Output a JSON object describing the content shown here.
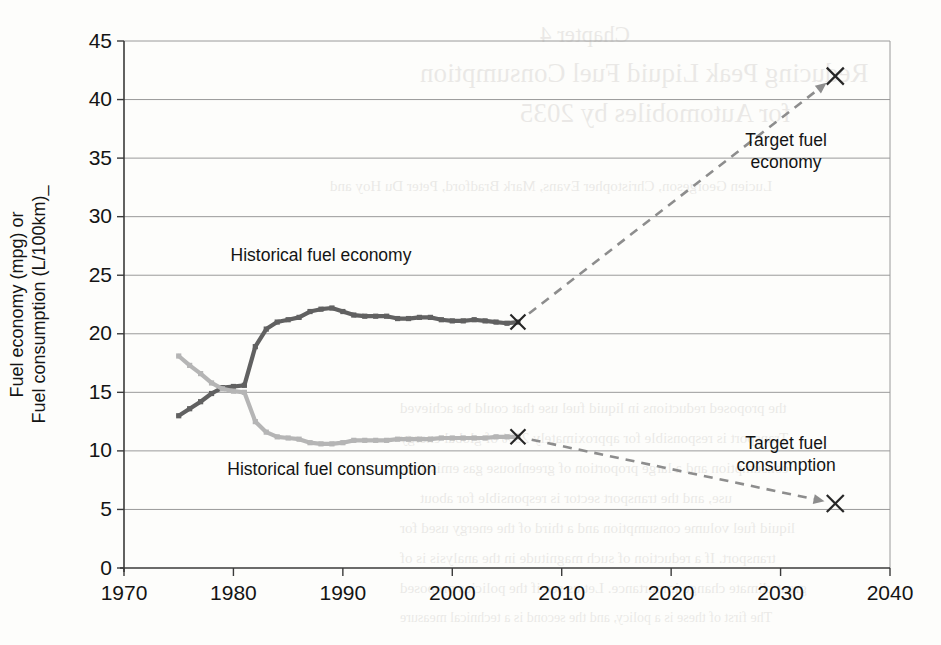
{
  "figure": {
    "background_color": "#fdfdfb",
    "plot_border_color": "#3a3a3a",
    "grid_color": "#9a9a9a"
  },
  "labels": {
    "y_axis_line1": "Fuel economy (mpg) or",
    "y_axis_line2": "Fuel consumption (L/100km)_",
    "series_economy": "Historical fuel economy",
    "series_consumption": "Historical fuel consumption",
    "target_economy_line1": "Target fuel",
    "target_economy_line2": "economy",
    "target_consumption_line1": "Target fuel",
    "target_consumption_line2": "consumption"
  },
  "bleed_through": [
    {
      "text": "Chapter 4",
      "x": 540,
      "y": 22,
      "size": 23
    },
    {
      "text": "Reducing Peak Liquid Fuel Consumption",
      "x": 420,
      "y": 58,
      "size": 27
    },
    {
      "text": "for Automobiles by 2035",
      "x": 520,
      "y": 98,
      "size": 27
    },
    {
      "text": "Lucien Georgeson, Christopher Evans, Mark Bradford, Peter Du Hoy and",
      "x": 330,
      "y": 178,
      "size": 15
    },
    {
      "text": "the proposed reductions in liquid fuel use that could be achieved",
      "x": 400,
      "y": 400,
      "size": 15
    },
    {
      "text": "Transport is responsible for approximately 25% of global energy",
      "x": 400,
      "y": 430,
      "size": 15
    },
    {
      "text": "consumption and a large proportion of greenhouse gas emissions",
      "x": 400,
      "y": 460,
      "size": 15
    },
    {
      "text": "use, and the transport sector is responsible for about",
      "x": 420,
      "y": 490,
      "size": 15
    },
    {
      "text": "liquid fuel volume consumption and a third of the energy used for",
      "x": 400,
      "y": 520,
      "size": 15
    },
    {
      "text": "transport. If a reduction of such magnitude in the analysis is of",
      "x": 400,
      "y": 550,
      "size": 15
    },
    {
      "text": "great climate change importance. Let us see if the policies proposed",
      "x": 400,
      "y": 580,
      "size": 15
    },
    {
      "text": "The first of these is a policy, and the second is a technical measure",
      "x": 400,
      "y": 610,
      "size": 14
    }
  ],
  "chart_data": {
    "type": "line",
    "title": "",
    "xlabel": "",
    "ylabel": "Fuel economy (mpg) or Fuel consumption (L/100km)",
    "xlim": [
      1970,
      2040
    ],
    "ylim": [
      0,
      45
    ],
    "x_ticks": [
      1970,
      1980,
      1990,
      2000,
      2010,
      2020,
      2030,
      2040
    ],
    "y_ticks": [
      0,
      5,
      10,
      15,
      20,
      25,
      30,
      35,
      40,
      45
    ],
    "grid": "horizontal",
    "legend": "in-plot annotations",
    "series": [
      {
        "name": "Historical fuel economy",
        "units": "mpg",
        "color": "#616161",
        "marker": "square",
        "x": [
          1975,
          1976,
          1977,
          1978,
          1979,
          1980,
          1981,
          1982,
          1983,
          1984,
          1985,
          1986,
          1987,
          1988,
          1989,
          1990,
          1991,
          1992,
          1993,
          1994,
          1995,
          1996,
          1997,
          1998,
          1999,
          2000,
          2001,
          2002,
          2003,
          2004,
          2005,
          2006
        ],
        "values": [
          13.0,
          13.6,
          14.2,
          14.9,
          15.4,
          15.5,
          15.6,
          18.9,
          20.4,
          21.0,
          21.2,
          21.4,
          21.9,
          22.1,
          22.2,
          21.9,
          21.6,
          21.5,
          21.5,
          21.5,
          21.3,
          21.3,
          21.4,
          21.4,
          21.2,
          21.1,
          21.1,
          21.2,
          21.1,
          21.0,
          20.9,
          21.0
        ]
      },
      {
        "name": "Historical fuel consumption",
        "units": "L/100km",
        "color": "#b5b5b5",
        "marker": "square",
        "x": [
          1975,
          1976,
          1977,
          1978,
          1979,
          1980,
          1981,
          1982,
          1983,
          1984,
          1985,
          1986,
          1987,
          1988,
          1989,
          1990,
          1991,
          1992,
          1993,
          1994,
          1995,
          1996,
          1997,
          1998,
          1999,
          2000,
          2001,
          2002,
          2003,
          2004,
          2005,
          2006
        ],
        "values": [
          18.1,
          17.3,
          16.6,
          15.8,
          15.3,
          15.1,
          15.0,
          12.5,
          11.6,
          11.2,
          11.1,
          11.0,
          10.7,
          10.6,
          10.6,
          10.7,
          10.9,
          10.9,
          10.9,
          10.9,
          11.0,
          11.0,
          11.0,
          11.0,
          11.1,
          11.1,
          11.1,
          11.1,
          11.1,
          11.2,
          11.2,
          11.2
        ]
      }
    ],
    "targets": [
      {
        "name": "Target fuel economy",
        "x": 2035,
        "y": 42.0,
        "marker": "x",
        "from_x": 2006,
        "from_y": 21.0
      },
      {
        "name": "Target fuel consumption",
        "x": 2035,
        "y": 5.5,
        "marker": "x",
        "from_x": 2006,
        "from_y": 11.2
      }
    ],
    "annotations": [
      {
        "text": "Historical fuel economy",
        "x": 1988,
        "y": 26.2
      },
      {
        "text": "Historical fuel consumption",
        "x": 1989,
        "y": 7.9
      },
      {
        "text": "Target fuel economy",
        "x": 2030.5,
        "y": 36.0
      },
      {
        "text": "Target fuel consumption",
        "x": 2030.5,
        "y": 10.2
      }
    ]
  }
}
